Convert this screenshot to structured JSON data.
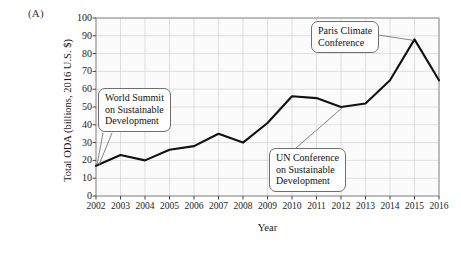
{
  "figure": {
    "panel_label": "(A)"
  },
  "chart_data": {
    "type": "line",
    "title": "",
    "xlabel": "Year",
    "ylabel": "Total ODA (billions, 2016 U.S. $)",
    "categories": [
      "2002",
      "2003",
      "2004",
      "2005",
      "2006",
      "2007",
      "2008",
      "2009",
      "2010",
      "2011",
      "2012",
      "2013",
      "2014",
      "2015",
      "2016"
    ],
    "x": [
      2002,
      2003,
      2004,
      2005,
      2006,
      2007,
      2008,
      2009,
      2010,
      2011,
      2012,
      2013,
      2014,
      2015,
      2016
    ],
    "values": [
      17,
      23,
      20,
      26,
      28,
      35,
      30,
      41,
      56,
      55,
      50,
      52,
      65,
      88,
      65
    ],
    "series": [
      {
        "name": "Total ODA",
        "values": [
          17,
          23,
          20,
          26,
          28,
          35,
          30,
          41,
          56,
          55,
          50,
          52,
          65,
          88,
          65
        ]
      }
    ],
    "xlim": [
      2002,
      2016
    ],
    "ylim": [
      0,
      100
    ],
    "ytick_labels": [
      "0",
      "10",
      "20",
      "30",
      "40",
      "50",
      "60",
      "70",
      "80",
      "90",
      "100"
    ],
    "yticks": [
      0,
      10,
      20,
      30,
      40,
      50,
      60,
      70,
      80,
      90,
      100
    ],
    "xtick_labels": [
      "2002",
      "2003",
      "2004",
      "2005",
      "2006",
      "2007",
      "2008",
      "2009",
      "2010",
      "2011",
      "2012",
      "2013",
      "2014",
      "2015",
      "2016"
    ],
    "grid": true,
    "legend": "none",
    "line_color": "#111111",
    "grid_color": "#d2d2d2",
    "plot_background": "#fbfbfb",
    "annotations": [
      {
        "id": "wssd",
        "text_lines": [
          "World Summit",
          "on Sustainable",
          "Development"
        ],
        "points_to_x": 2002,
        "points_to_y": 17
      },
      {
        "id": "paris",
        "text_lines": [
          "Paris Climate",
          "Conference"
        ],
        "points_to_x": 2015,
        "points_to_y": 88
      },
      {
        "id": "unc",
        "text_lines": [
          "UN Conference",
          "on Sustainable",
          "Development"
        ],
        "points_to_x": 2012,
        "points_to_y": 50
      }
    ]
  }
}
